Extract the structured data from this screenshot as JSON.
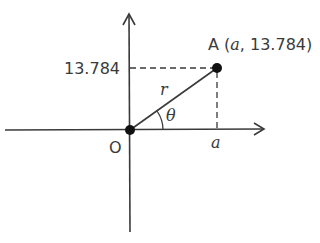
{
  "diagram": {
    "point_label": "A",
    "point_coords_open": " (",
    "point_coord_x": "a",
    "point_coords_sep": ", 13.784)",
    "y_value_label": "13.784",
    "radius_label": "r",
    "angle_label": "θ",
    "origin_label": "O",
    "x_value_label": "a"
  },
  "colors": {
    "line": "#3a3a3a",
    "point": "#111111"
  }
}
